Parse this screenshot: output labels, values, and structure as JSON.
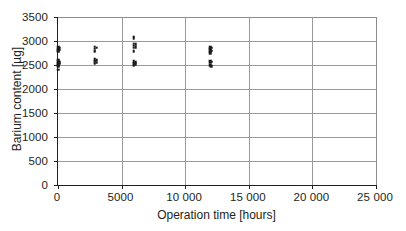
{
  "chart_data": {
    "type": "scatter",
    "title": "",
    "xlabel": "Operation time [hours]",
    "ylabel": "Barium content [µg]",
    "xlim": [
      0,
      25000
    ],
    "ylim": [
      0,
      3500
    ],
    "grid": true,
    "legend": "none",
    "marker": "small black square",
    "x_ticks": [
      0,
      5000,
      10000,
      15000,
      20000,
      25000
    ],
    "x_tick_labels": [
      "0",
      "5000",
      "10 000",
      "15 000",
      "20 000",
      "25 000"
    ],
    "y_ticks": [
      0,
      500,
      1000,
      1500,
      2000,
      2500,
      3000,
      3500
    ],
    "y_tick_labels": [
      "0",
      "500",
      "1000",
      "1500",
      "2000",
      "2500",
      "3000",
      "3500"
    ],
    "series": [
      {
        "name": "Barium content samples",
        "points": [
          {
            "x": 0,
            "y": 2880
          },
          {
            "x": 0,
            "y": 2840
          },
          {
            "x": 0,
            "y": 2810
          },
          {
            "x": 0,
            "y": 2790
          },
          {
            "x": 0,
            "y": 2610
          },
          {
            "x": 0,
            "y": 2580
          },
          {
            "x": 0,
            "y": 2550
          },
          {
            "x": 0,
            "y": 2520
          },
          {
            "x": 0,
            "y": 2500
          },
          {
            "x": 0,
            "y": 2470
          },
          {
            "x": 0,
            "y": 2400
          },
          {
            "x": 100,
            "y": 2860
          },
          {
            "x": 100,
            "y": 2820
          },
          {
            "x": 100,
            "y": 2560
          },
          {
            "x": 100,
            "y": 2530
          },
          {
            "x": 2900,
            "y": 2880
          },
          {
            "x": 2900,
            "y": 2840
          },
          {
            "x": 2900,
            "y": 2800
          },
          {
            "x": 2900,
            "y": 2780
          },
          {
            "x": 2900,
            "y": 2620
          },
          {
            "x": 2900,
            "y": 2590
          },
          {
            "x": 2900,
            "y": 2560
          },
          {
            "x": 2900,
            "y": 2530
          },
          {
            "x": 3050,
            "y": 2860
          },
          {
            "x": 3050,
            "y": 2600
          },
          {
            "x": 3050,
            "y": 2550
          },
          {
            "x": 5950,
            "y": 3090
          },
          {
            "x": 5950,
            "y": 3060
          },
          {
            "x": 5950,
            "y": 2940
          },
          {
            "x": 5950,
            "y": 2900
          },
          {
            "x": 5950,
            "y": 2860
          },
          {
            "x": 5950,
            "y": 2790
          },
          {
            "x": 5950,
            "y": 2580
          },
          {
            "x": 5950,
            "y": 2550
          },
          {
            "x": 5950,
            "y": 2520
          },
          {
            "x": 5950,
            "y": 2500
          },
          {
            "x": 6100,
            "y": 2930
          },
          {
            "x": 6100,
            "y": 2870
          },
          {
            "x": 6100,
            "y": 2560
          },
          {
            "x": 6100,
            "y": 2520
          },
          {
            "x": 11950,
            "y": 2870
          },
          {
            "x": 11950,
            "y": 2840
          },
          {
            "x": 11950,
            "y": 2810
          },
          {
            "x": 11950,
            "y": 2780
          },
          {
            "x": 11950,
            "y": 2750
          },
          {
            "x": 11950,
            "y": 2590
          },
          {
            "x": 11950,
            "y": 2560
          },
          {
            "x": 11950,
            "y": 2490
          },
          {
            "x": 12050,
            "y": 2860
          },
          {
            "x": 12050,
            "y": 2800
          },
          {
            "x": 12050,
            "y": 2570
          },
          {
            "x": 12050,
            "y": 2480
          }
        ]
      }
    ]
  }
}
